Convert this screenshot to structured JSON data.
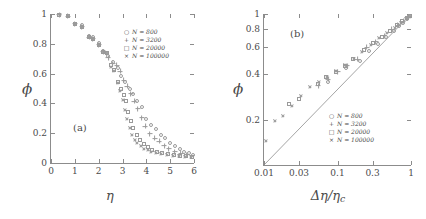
{
  "figure": {
    "panels": [
      {
        "tag": "(a)",
        "xlabel": "η",
        "ylabel": "ϕ",
        "xticks": [
          "0",
          "1",
          "2",
          "3",
          "4",
          "5",
          "6"
        ],
        "yticks": [
          "0",
          "0.2",
          "0.4",
          "0.6",
          "0.8",
          "1"
        ],
        "legend": [
          {
            "symbol": "○",
            "label": "N = 800"
          },
          {
            "symbol": "+",
            "label": "N = 3200"
          },
          {
            "symbol": "□",
            "label": "N = 20000"
          },
          {
            "symbol": "×",
            "label": "N = 100000"
          }
        ]
      },
      {
        "tag": "(b)",
        "xlabel_main": "Δη/η",
        "xlabel_sub": "c",
        "ylabel": "ϕ",
        "xticks": [
          "0.01",
          "0.03",
          "0.1",
          "0.3",
          "1"
        ],
        "yticks": [
          "0.2",
          "0.4",
          "0.6",
          "0.8",
          "1"
        ],
        "legend": [
          {
            "symbol": "○",
            "label": "N = 800"
          },
          {
            "symbol": "+",
            "label": "N = 3200"
          },
          {
            "symbol": "□",
            "label": "N = 20000"
          },
          {
            "symbol": "×",
            "label": "N = 100000"
          }
        ]
      }
    ]
  },
  "chart_data": [
    {
      "type": "scatter",
      "panel": "(a)",
      "title": "",
      "xlabel": "η",
      "ylabel": "ϕ",
      "xlim": [
        0,
        6
      ],
      "ylim": [
        0,
        1
      ],
      "xscale": "linear",
      "yscale": "linear",
      "xticks": [
        0,
        1,
        2,
        3,
        4,
        5,
        6
      ],
      "yticks": [
        0,
        0.2,
        0.4,
        0.6,
        0.8,
        1
      ],
      "grid": false,
      "legend_position": "upper-right",
      "series": [
        {
          "name": "N = 800",
          "marker": "circle",
          "points": [
            [
              0.35,
              0.995
            ],
            [
              0.7,
              0.985
            ],
            [
              1.0,
              0.935
            ],
            [
              1.3,
              0.925
            ],
            [
              1.6,
              0.855
            ],
            [
              1.75,
              0.845
            ],
            [
              2.0,
              0.805
            ],
            [
              2.2,
              0.755
            ],
            [
              2.4,
              0.715
            ],
            [
              2.6,
              0.675
            ],
            [
              2.8,
              0.635
            ],
            [
              2.95,
              0.585
            ],
            [
              3.1,
              0.545
            ],
            [
              3.3,
              0.495
            ],
            [
              3.45,
              0.465
            ],
            [
              3.6,
              0.415
            ],
            [
              3.8,
              0.375
            ],
            [
              4.0,
              0.295
            ],
            [
              4.2,
              0.255
            ],
            [
              4.4,
              0.225
            ],
            [
              4.6,
              0.185
            ],
            [
              4.8,
              0.165
            ],
            [
              5.0,
              0.135
            ],
            [
              5.2,
              0.115
            ],
            [
              5.4,
              0.095
            ],
            [
              5.6,
              0.075
            ],
            [
              5.8,
              0.065
            ],
            [
              5.95,
              0.055
            ]
          ]
        },
        {
          "name": "N = 3200",
          "marker": "plus",
          "points": [
            [
              0.35,
              0.995
            ],
            [
              0.7,
              0.985
            ],
            [
              1.0,
              0.935
            ],
            [
              1.3,
              0.915
            ],
            [
              1.6,
              0.845
            ],
            [
              1.75,
              0.835
            ],
            [
              2.0,
              0.795
            ],
            [
              2.2,
              0.745
            ],
            [
              2.4,
              0.705
            ],
            [
              2.6,
              0.665
            ],
            [
              2.75,
              0.655
            ],
            [
              2.9,
              0.615
            ],
            [
              3.05,
              0.555
            ],
            [
              3.2,
              0.515
            ],
            [
              3.35,
              0.465
            ],
            [
              3.5,
              0.415
            ],
            [
              3.65,
              0.365
            ],
            [
              3.8,
              0.305
            ],
            [
              3.95,
              0.245
            ],
            [
              4.15,
              0.195
            ],
            [
              4.35,
              0.165
            ],
            [
              4.55,
              0.145
            ],
            [
              4.75,
              0.115
            ],
            [
              4.95,
              0.095
            ],
            [
              5.2,
              0.075
            ],
            [
              5.45,
              0.065
            ],
            [
              5.7,
              0.055
            ]
          ]
        },
        {
          "name": "N = 20000",
          "marker": "square",
          "points": [
            [
              0.35,
              0.995
            ],
            [
              0.7,
              0.985
            ],
            [
              1.0,
              0.935
            ],
            [
              1.3,
              0.915
            ],
            [
              1.6,
              0.845
            ],
            [
              1.75,
              0.835
            ],
            [
              2.0,
              0.795
            ],
            [
              2.2,
              0.745
            ],
            [
              2.35,
              0.735
            ],
            [
              2.5,
              0.655
            ],
            [
              2.65,
              0.625
            ],
            [
              2.8,
              0.545
            ],
            [
              2.95,
              0.495
            ],
            [
              3.05,
              0.455
            ],
            [
              3.15,
              0.415
            ],
            [
              3.25,
              0.345
            ],
            [
              3.35,
              0.285
            ],
            [
              3.45,
              0.235
            ],
            [
              3.6,
              0.185
            ],
            [
              3.75,
              0.155
            ],
            [
              3.9,
              0.125
            ],
            [
              4.05,
              0.105
            ],
            [
              4.25,
              0.085
            ],
            [
              4.45,
              0.075
            ],
            [
              4.65,
              0.065
            ],
            [
              4.9,
              0.058
            ],
            [
              5.15,
              0.052
            ],
            [
              5.4,
              0.048
            ],
            [
              5.65,
              0.045
            ],
            [
              5.9,
              0.042
            ]
          ]
        },
        {
          "name": "N = 100000",
          "marker": "cross",
          "points": [
            [
              0.35,
              0.995
            ],
            [
              0.7,
              0.985
            ],
            [
              1.0,
              0.935
            ],
            [
              1.3,
              0.915
            ],
            [
              1.6,
              0.845
            ],
            [
              1.75,
              0.835
            ],
            [
              2.0,
              0.795
            ],
            [
              2.2,
              0.745
            ],
            [
              2.35,
              0.735
            ],
            [
              2.5,
              0.645
            ],
            [
              2.65,
              0.615
            ],
            [
              2.8,
              0.535
            ],
            [
              2.9,
              0.485
            ],
            [
              3.0,
              0.425
            ],
            [
              3.1,
              0.355
            ],
            [
              3.2,
              0.295
            ],
            [
              3.3,
              0.235
            ],
            [
              3.4,
              0.185
            ],
            [
              3.5,
              0.155
            ],
            [
              3.62,
              0.135
            ],
            [
              3.75,
              0.115
            ],
            [
              3.9,
              0.095
            ],
            [
              4.05,
              0.085
            ],
            [
              4.2,
              0.075
            ],
            [
              4.4,
              0.068
            ],
            [
              4.6,
              0.062
            ],
            [
              4.85,
              0.055
            ],
            [
              5.1,
              0.05
            ],
            [
              5.35,
              0.046
            ],
            [
              5.6,
              0.043
            ],
            [
              5.85,
              0.04
            ]
          ]
        }
      ]
    },
    {
      "type": "scatter",
      "panel": "(b)",
      "title": "",
      "xlabel": "Δη/ηc",
      "ylabel": "ϕ",
      "xlim": [
        0.01,
        1
      ],
      "ylim": [
        0.1,
        1
      ],
      "xscale": "log",
      "yscale": "log",
      "xticks": [
        0.01,
        0.03,
        0.1,
        0.3,
        1
      ],
      "yticks": [
        0.2,
        0.4,
        0.6,
        0.8,
        1
      ],
      "grid": false,
      "legend_position": "lower-right",
      "annotations": [
        {
          "type": "line",
          "description": "reference power law, slope 0.5",
          "from": [
            0.01,
            0.1
          ],
          "to": [
            1.0,
            1.0
          ]
        }
      ],
      "series": [
        {
          "name": "N = 800",
          "marker": "circle",
          "points": [
            [
              0.075,
              0.355
            ],
            [
              0.13,
              0.44
            ],
            [
              0.2,
              0.49
            ],
            [
              0.27,
              0.565
            ],
            [
              0.36,
              0.635
            ],
            [
              0.46,
              0.705
            ],
            [
              0.58,
              0.775
            ],
            [
              0.68,
              0.83
            ],
            [
              0.78,
              0.875
            ],
            [
              0.87,
              0.925
            ],
            [
              0.95,
              0.965
            ]
          ]
        },
        {
          "name": "N = 3200",
          "marker": "plus",
          "points": [
            [
              0.055,
              0.335
            ],
            [
              0.075,
              0.37
            ],
            [
              0.1,
              0.415
            ],
            [
              0.135,
              0.455
            ],
            [
              0.185,
              0.5
            ],
            [
              0.25,
              0.6
            ],
            [
              0.33,
              0.655
            ],
            [
              0.43,
              0.715
            ],
            [
              0.55,
              0.79
            ],
            [
              0.66,
              0.845
            ],
            [
              0.78,
              0.895
            ],
            [
              0.9,
              0.945
            ]
          ]
        },
        {
          "name": "N = 20000",
          "marker": "square",
          "points": [
            [
              0.022,
              0.255
            ],
            [
              0.03,
              0.275
            ],
            [
              0.055,
              0.345
            ],
            [
              0.07,
              0.38
            ],
            [
              0.095,
              0.415
            ],
            [
              0.125,
              0.455
            ],
            [
              0.165,
              0.5
            ],
            [
              0.23,
              0.58
            ],
            [
              0.3,
              0.64
            ],
            [
              0.4,
              0.705
            ],
            [
              0.52,
              0.775
            ],
            [
              0.64,
              0.845
            ],
            [
              0.76,
              0.895
            ],
            [
              0.88,
              0.94
            ],
            [
              0.96,
              0.975
            ]
          ]
        },
        {
          "name": "N = 100000",
          "marker": "cross",
          "points": [
            [
              0.0105,
              0.145
            ],
            [
              0.014,
              0.195
            ],
            [
              0.018,
              0.21
            ],
            [
              0.024,
              0.245
            ],
            [
              0.032,
              0.285
            ],
            [
              0.042,
              0.33
            ],
            [
              0.055,
              0.355
            ],
            [
              0.072,
              0.385
            ],
            [
              0.095,
              0.42
            ],
            [
              0.125,
              0.46
            ],
            [
              0.165,
              0.5
            ],
            [
              0.215,
              0.56
            ],
            [
              0.28,
              0.62
            ],
            [
              0.37,
              0.69
            ],
            [
              0.47,
              0.75
            ],
            [
              0.6,
              0.81
            ],
            [
              0.72,
              0.87
            ],
            [
              0.85,
              0.925
            ],
            [
              0.95,
              0.96
            ]
          ]
        }
      ]
    }
  ]
}
